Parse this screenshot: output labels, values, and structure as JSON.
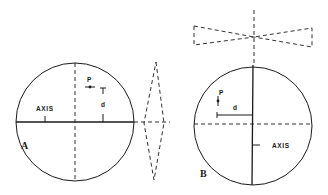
{
  "figure": {
    "panels": [
      {
        "id": "A",
        "panel_label": "A",
        "axis_label": "AXIS",
        "point_label": "P",
        "distance_label": "d",
        "axis_orientation": "horizontal",
        "projection_shape": "diamond (dashed), to the right"
      },
      {
        "id": "B",
        "panel_label": "B",
        "axis_label": "AXIS",
        "point_label": "P",
        "distance_label": "d",
        "axis_orientation": "vertical",
        "projection_shape": "bowtie (dashed), above"
      }
    ],
    "colors": {
      "ink": "#1a1a1a",
      "background": "#ffffff"
    }
  }
}
